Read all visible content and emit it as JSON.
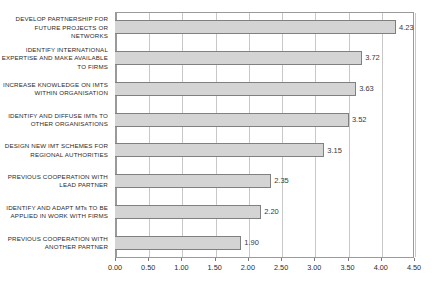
{
  "chart_data": {
    "type": "bar",
    "orientation": "horizontal",
    "title": "",
    "subtitle": "",
    "xlabel": "",
    "ylabel": "",
    "xlim": [
      0.0,
      4.5
    ],
    "grid": true,
    "legend": false,
    "legend_position": "none",
    "tick_step": 0.5,
    "xticks": [
      "0.00",
      "0.50",
      "1.00",
      "1.50",
      "2.00",
      "2.50",
      "3.00",
      "3.50",
      "4.00",
      "4.50"
    ],
    "xtick_values": [
      0.0,
      0.5,
      1.0,
      1.5,
      2.0,
      2.5,
      3.0,
      3.5,
      4.0,
      4.5
    ],
    "categories": [
      "DEVELOP PARTNERSHIP FOR FUTURE PROJECTS OR NETWORKS",
      "IDENTIFY INTERNATIONAL EXPERTISE AND MAKE AVAILABLE TO FIRMS",
      "INCREASE KNOWLEDGE ON IMTS WITHIN ORGANISATION",
      "IDENTIFY AND DIFFUSE IMTs TO OTHER ORGANISATIONS",
      "DESIGN NEW IMT SCHEMES FOR REGIONAL AUTHORITIES",
      "PREVIOUS COOPERATION WITH LEAD PARTNER",
      "IDENTIFY AND ADAPT MTs TO BE APPLIED IN WORK WITH FIRMS",
      "PREVIOUS COOPERATION WITH ANOTHER PARTNER"
    ],
    "values": [
      4.23,
      3.72,
      3.63,
      3.52,
      3.15,
      2.35,
      2.2,
      1.9
    ],
    "value_labels": [
      "4.23",
      "3.72",
      "3.63",
      "3.52",
      "3.15",
      "2.35",
      "2.20",
      "1.90"
    ],
    "colors": {
      "bar_fill": "#d4d4d4",
      "bar_border": "#808080",
      "gridline": "#c8c8c8",
      "axis": "#9a9a9a",
      "text": "#2b2b2b",
      "background": "#ffffff"
    }
  }
}
